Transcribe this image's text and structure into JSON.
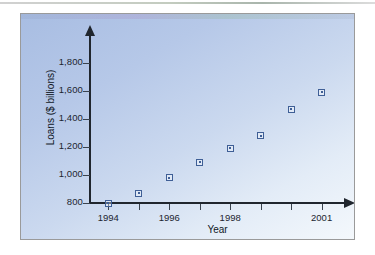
{
  "figure": {
    "panel_border_color": "#9a9a9a",
    "background_gradient_from": "#a8bde2",
    "background_gradient_to": "#f4f8fc",
    "marker_color": "#3f5f96",
    "axis_color": "#20262e"
  },
  "chart_data": {
    "type": "scatter",
    "title": "",
    "xlabel": "Year",
    "ylabel": "Loans ($ billions)",
    "x": [
      1994,
      1995,
      1996,
      1997,
      1998,
      1999,
      2000,
      2001
    ],
    "values": [
      800,
      870,
      980,
      1090,
      1190,
      1280,
      1470,
      1590
    ],
    "series": [
      {
        "name": "Loans",
        "points": [
          {
            "x": 1994,
            "y": 800
          },
          {
            "x": 1995,
            "y": 870
          },
          {
            "x": 1996,
            "y": 980
          },
          {
            "x": 1997,
            "y": 1090
          },
          {
            "x": 1998,
            "y": 1190
          },
          {
            "x": 1999,
            "y": 1280
          },
          {
            "x": 2000,
            "y": 1470
          },
          {
            "x": 2001,
            "y": 1590
          }
        ]
      }
    ],
    "xlim": [
      1993.4,
      2001.8
    ],
    "ylim": [
      800,
      1900
    ],
    "ytick_values": [
      800,
      1000,
      1200,
      1400,
      1600,
      1800
    ],
    "ytick_labels": [
      "800",
      "1,000",
      "1,200",
      "1,400",
      "1,600",
      "1,800"
    ],
    "xtick_values": [
      1994,
      1995,
      1996,
      1997,
      1998,
      1999,
      2000,
      2001
    ],
    "xtick_labels": [
      "1994",
      "",
      "1996",
      "",
      "1998",
      "",
      "",
      "2001"
    ],
    "grid": false,
    "legend": "none",
    "marker": "open-square"
  }
}
